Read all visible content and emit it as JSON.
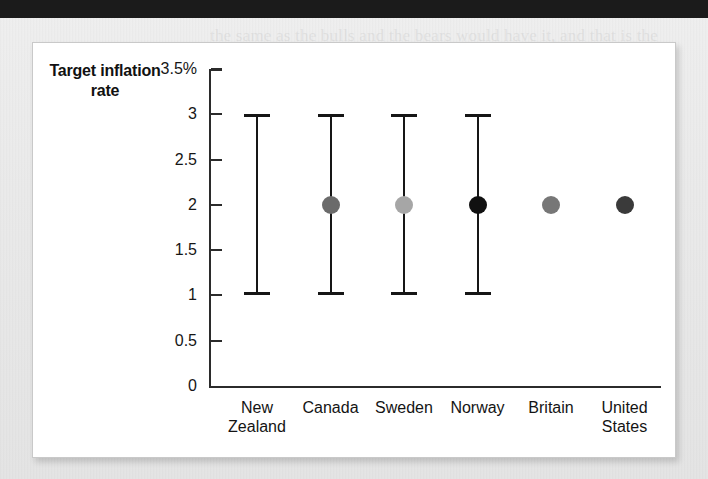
{
  "page": {
    "top_bar_color": "#1b1b1b",
    "paper_color": "#eaeaea",
    "card_color": "#ffffff",
    "ghost_text": "the same as the bulls and the bears would have it, and that is the\nexpectation for inflation in the years to come. The\ntargets vary, but the bands around the central point\nare all the same. For some central banks the\nnumbers matter less than the signal they send\nabout intentions for the years ahead, while\nothers treat the midpoint as a hard promise.\nCritics say the framework is too rigid, but\nsupporters reply that credibility is what keeps\nexpectations anchored in the first place."
  },
  "chart_data": {
    "type": "scatter",
    "title": "Target inflation rate",
    "xlabel": "",
    "ylabel": "Target inflation rate",
    "ylim": [
      0,
      3.5
    ],
    "grid": false,
    "legend": "none",
    "y_ticks": [
      "3.5%",
      "3",
      "2.5",
      "2",
      "1.5",
      "1",
      "0.5",
      "0"
    ],
    "y_tick_values": [
      3.5,
      3,
      2.5,
      2,
      1.5,
      1,
      0.5,
      0
    ],
    "categories": [
      "New\nZealand",
      "Canada",
      "Sweden",
      "Norway",
      "Britain",
      "United\nStates"
    ],
    "points": [
      {
        "category": "New Zealand",
        "label": "New\nZealand",
        "target": null,
        "range_low": 1,
        "range_high": 3,
        "has_dot": false,
        "has_range": true,
        "dot_color": "#000000"
      },
      {
        "category": "Canada",
        "label": "Canada",
        "target": 2,
        "range_low": 1,
        "range_high": 3,
        "has_dot": true,
        "has_range": true,
        "dot_color": "#6b6b6b"
      },
      {
        "category": "Sweden",
        "label": "Sweden",
        "target": 2,
        "range_low": 1,
        "range_high": 3,
        "has_dot": true,
        "has_range": true,
        "dot_color": "#a6a6a6"
      },
      {
        "category": "Norway",
        "label": "Norway",
        "target": 2,
        "range_low": 1,
        "range_high": 3,
        "has_dot": true,
        "has_range": true,
        "dot_color": "#111111"
      },
      {
        "category": "Britain",
        "label": "Britain",
        "target": 2,
        "range_low": null,
        "range_high": null,
        "has_dot": true,
        "has_range": false,
        "dot_color": "#777777"
      },
      {
        "category": "United States",
        "label": "United\nStates",
        "target": 2,
        "range_low": null,
        "range_high": null,
        "has_dot": true,
        "has_range": false,
        "dot_color": "#3a3a3a"
      }
    ]
  }
}
